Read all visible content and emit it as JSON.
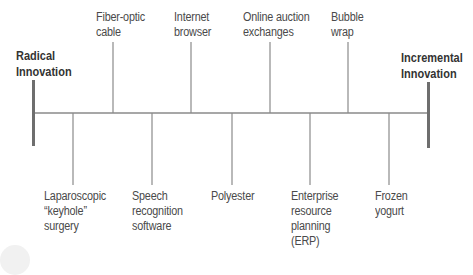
{
  "diagram": {
    "type": "spectrum-timeline",
    "left_end": {
      "label_line1": "Radical",
      "label_line2": "Innovation"
    },
    "right_end": {
      "label_line1": "Incremental",
      "label_line2": "Innovation"
    },
    "items_above": [
      {
        "line1": "Fiber-optic",
        "line2": "cable"
      },
      {
        "line1": "Internet",
        "line2": "browser"
      },
      {
        "line1": "Online auction",
        "line2": "exchanges"
      },
      {
        "line1": "Bubble",
        "line2": "wrap"
      }
    ],
    "items_below": [
      {
        "line1": "Laparoscopic",
        "line2": "“keyhole”",
        "line3": "surgery"
      },
      {
        "line1": "Speech",
        "line2": "recognition",
        "line3": "software"
      },
      {
        "line1": "Polyester"
      },
      {
        "line1": "Enterprise",
        "line2": "resource",
        "line3": "planning",
        "line4": "(ERP)"
      },
      {
        "line1": "Frozen",
        "line2": "yogurt"
      }
    ],
    "colors": {
      "line": "#8a8a8a",
      "endcap": "#6e6e6e",
      "text": "#4a4a4a"
    }
  }
}
